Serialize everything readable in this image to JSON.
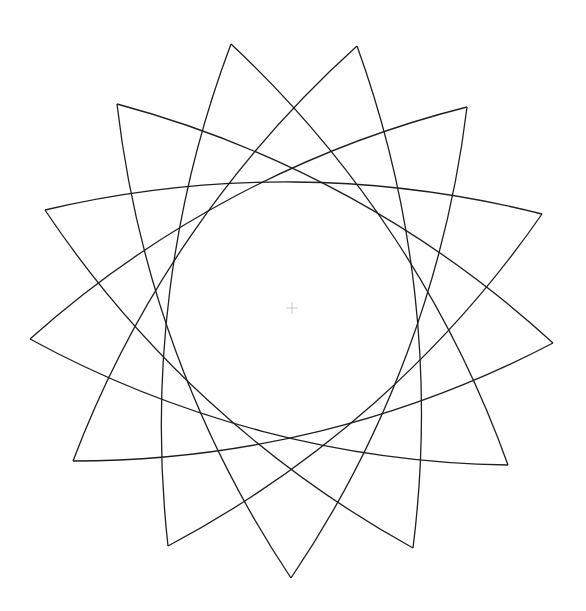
{
  "figure": {
    "width": 586,
    "height": 611,
    "background": "#ffffff",
    "stroke_color": "#1e1e1e",
    "stroke_width": 1.3,
    "center": {
      "x": 292,
      "y": 308
    },
    "center_marker_color": "#b8b8b8",
    "center_marker_size": 6,
    "tips": [
      {
        "x": 231,
        "y": 44
      },
      {
        "x": 357,
        "y": 46
      },
      {
        "x": 467,
        "y": 107
      },
      {
        "x": 542,
        "y": 214
      },
      {
        "x": 553,
        "y": 343
      },
      {
        "x": 508,
        "y": 465
      },
      {
        "x": 413,
        "y": 548
      },
      {
        "x": 291,
        "y": 578
      },
      {
        "x": 168,
        "y": 546
      },
      {
        "x": 73,
        "y": 461
      },
      {
        "x": 30,
        "y": 339
      },
      {
        "x": 45,
        "y": 210
      },
      {
        "x": 117,
        "y": 104
      }
    ],
    "arc_step": 5,
    "arc_sagitta": 30
  }
}
